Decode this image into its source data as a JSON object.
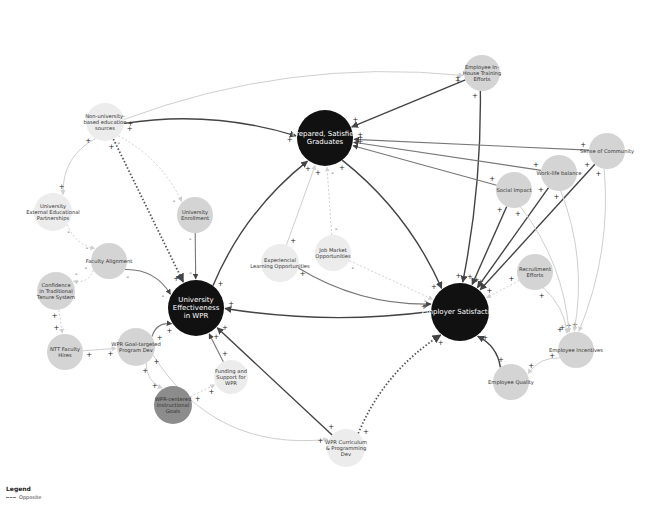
{
  "legend": {
    "title": "Legend",
    "items": [
      {
        "label": "Opposite",
        "style": "dashed"
      }
    ]
  },
  "colors": {
    "major_node": "#111111",
    "minor_node": "#d4d4d4",
    "light_node": "#ececec",
    "dark_node": "#8c8c8c",
    "edge_dark": "#444444",
    "edge_light": "#cfcfcf"
  },
  "nodes": [
    {
      "id": "graduates",
      "label": [
        "Prepared, Satisfied",
        "Graduates"
      ],
      "x": 325,
      "y": 138,
      "r": 28,
      "type": "major"
    },
    {
      "id": "effectiveness",
      "label": [
        "University",
        "Effectiveness",
        "in WPR"
      ],
      "x": 196,
      "y": 308,
      "r": 28,
      "type": "major"
    },
    {
      "id": "employer",
      "label": [
        "Employer Satisfaction"
      ],
      "x": 460,
      "y": 312,
      "r": 29,
      "type": "major"
    },
    {
      "id": "nonuni",
      "label": [
        "Non-university-",
        "based education",
        "sources"
      ],
      "x": 105,
      "y": 122,
      "r": 19,
      "type": "light"
    },
    {
      "id": "extpart",
      "label": [
        "University",
        "External Educational",
        "Partnerships"
      ],
      "x": 53,
      "y": 212,
      "r": 19,
      "type": "light"
    },
    {
      "id": "enrollment",
      "label": [
        "University",
        "Enrollment"
      ],
      "x": 195,
      "y": 215,
      "r": 18,
      "type": "minor"
    },
    {
      "id": "faculty",
      "label": [
        "Faculty Alignment"
      ],
      "x": 109,
      "y": 261,
      "r": 18,
      "type": "minor"
    },
    {
      "id": "tenure",
      "label": [
        "Confidence",
        "in Traditional",
        "Tenure System"
      ],
      "x": 56,
      "y": 291,
      "r": 19,
      "type": "minor"
    },
    {
      "id": "ntt",
      "label": [
        "NTT Faculty",
        "Hires"
      ],
      "x": 65,
      "y": 352,
      "r": 18,
      "type": "minor"
    },
    {
      "id": "goaldev",
      "label": [
        "WPR Goal-targeted",
        "Program Dev"
      ],
      "x": 136,
      "y": 347,
      "r": 19,
      "type": "minor"
    },
    {
      "id": "funding",
      "label": [
        "Funding and",
        "Support for",
        "WPR"
      ],
      "x": 231,
      "y": 377,
      "r": 17,
      "type": "light"
    },
    {
      "id": "instgoals",
      "label": [
        "WPR-centered",
        "Instructional",
        "Goals"
      ],
      "x": 173,
      "y": 405,
      "r": 19,
      "type": "dark"
    },
    {
      "id": "curriculum",
      "label": [
        "WPR Curriculum",
        "& Programming",
        "Dev"
      ],
      "x": 346,
      "y": 448,
      "r": 19,
      "type": "light"
    },
    {
      "id": "experiential",
      "label": [
        "Experiencial",
        "Learning Opportunities"
      ],
      "x": 280,
      "y": 263,
      "r": 19,
      "type": "light"
    },
    {
      "id": "jobmarket",
      "label": [
        "Job Market",
        "Opportunities"
      ],
      "x": 333,
      "y": 253,
      "r": 18,
      "type": "light"
    },
    {
      "id": "training",
      "label": [
        "Employee In-",
        "House Training",
        "Efforts"
      ],
      "x": 482,
      "y": 73,
      "r": 18,
      "type": "minor"
    },
    {
      "id": "community",
      "label": [
        "Sense of Community"
      ],
      "x": 607,
      "y": 151,
      "r": 18,
      "type": "minor"
    },
    {
      "id": "worklife",
      "label": [
        "Work-life balance"
      ],
      "x": 559,
      "y": 173,
      "r": 18,
      "type": "minor"
    },
    {
      "id": "social",
      "label": [
        "Social Impact"
      ],
      "x": 514,
      "y": 190,
      "r": 18,
      "type": "minor"
    },
    {
      "id": "recruitment",
      "label": [
        "Recruitment",
        "Efforts"
      ],
      "x": 535,
      "y": 272,
      "r": 18,
      "type": "minor"
    },
    {
      "id": "incentives",
      "label": [
        "Employee Incentives"
      ],
      "x": 576,
      "y": 350,
      "r": 18,
      "type": "minor"
    },
    {
      "id": "quality",
      "label": [
        "Employee Quality"
      ],
      "x": 511,
      "y": 382,
      "r": 18,
      "type": "minor"
    }
  ],
  "edges": [
    {
      "from": "nonuni",
      "to": "graduates",
      "style": "dark",
      "sign": "+",
      "curve": -20
    },
    {
      "from": "nonuni",
      "to": "effectiveness",
      "style": "dotted",
      "sign": "+",
      "curve": 0
    },
    {
      "from": "nonuni",
      "to": "enrollment",
      "style": "dashed-light",
      "sign": "-",
      "curve": -15
    },
    {
      "from": "nonuni",
      "to": "extpart",
      "style": "light",
      "sign": "+",
      "curve": 20
    },
    {
      "from": "extpart",
      "to": "faculty",
      "style": "dashed-light",
      "sign": "-",
      "curve": 10
    },
    {
      "from": "faculty",
      "to": "tenure",
      "style": "dashed-light",
      "sign": "-",
      "curve": -10
    },
    {
      "from": "tenure",
      "to": "ntt",
      "style": "dashed-light",
      "sign": "+",
      "curve": 0
    },
    {
      "from": "ntt",
      "to": "goaldev",
      "style": "light",
      "sign": "+",
      "curve": 0
    },
    {
      "from": "faculty",
      "to": "effectiveness",
      "style": "medium",
      "sign": "-",
      "curve": -15
    },
    {
      "from": "enrollment",
      "to": "effectiveness",
      "style": "medium",
      "sign": "-",
      "curve": 0
    },
    {
      "from": "goaldev",
      "to": "effectiveness",
      "style": "medium",
      "sign": "+",
      "curve": -10
    },
    {
      "from": "goaldev",
      "to": "instgoals",
      "style": "light",
      "sign": "+",
      "curve": 10
    },
    {
      "from": "instgoals",
      "to": "funding",
      "style": "dashed-light",
      "sign": "+",
      "curve": 0
    },
    {
      "from": "funding",
      "to": "effectiveness",
      "style": "medium",
      "sign": "+",
      "curve": 0
    },
    {
      "from": "curriculum",
      "to": "effectiveness",
      "style": "dark",
      "sign": "+",
      "curve": 0
    },
    {
      "from": "goaldev",
      "to": "curriculum",
      "style": "light",
      "sign": "+",
      "curve": 60
    },
    {
      "from": "curriculum",
      "to": "employer",
      "style": "dotted",
      "sign": "+",
      "curve": -20
    },
    {
      "from": "effectiveness",
      "to": "graduates",
      "style": "dark",
      "sign": "+",
      "curve": -20
    },
    {
      "from": "graduates",
      "to": "employer",
      "style": "dark",
      "sign": "+",
      "curve": -20
    },
    {
      "from": "employer",
      "to": "effectiveness",
      "style": "dark",
      "sign": "+",
      "curve": -15
    },
    {
      "from": "experiential",
      "to": "employer",
      "style": "medium",
      "sign": "+",
      "curve": 20
    },
    {
      "from": "experiential",
      "to": "graduates",
      "style": "light",
      "sign": "+",
      "curve": 0
    },
    {
      "from": "jobmarket",
      "to": "employer",
      "style": "dashed-light",
      "sign": "-",
      "curve": 0
    },
    {
      "from": "jobmarket",
      "to": "graduates",
      "style": "dashed-light",
      "sign": "-",
      "curve": 0
    },
    {
      "from": "training",
      "to": "graduates",
      "style": "dark",
      "sign": "+",
      "curve": 0
    },
    {
      "from": "training",
      "to": "employer",
      "style": "dark",
      "sign": "+",
      "curve": -10
    },
    {
      "from": "nonuni",
      "to": "training",
      "style": "light",
      "sign": "+",
      "curve": -40
    },
    {
      "from": "community",
      "to": "graduates",
      "style": "medium",
      "sign": "+",
      "curve": 0
    },
    {
      "from": "worklife",
      "to": "graduates",
      "style": "medium",
      "sign": "+",
      "curve": 0
    },
    {
      "from": "social",
      "to": "graduates",
      "style": "medium",
      "sign": "+",
      "curve": 0
    },
    {
      "from": "community",
      "to": "employer",
      "style": "dark",
      "sign": "+",
      "curve": 0
    },
    {
      "from": "worklife",
      "to": "employer",
      "style": "dark",
      "sign": "+",
      "curve": 0
    },
    {
      "from": "social",
      "to": "employer",
      "style": "dark",
      "sign": "+",
      "curve": 0
    },
    {
      "from": "recruitment",
      "to": "employer",
      "style": "dashed-light",
      "sign": "+",
      "curve": 0
    },
    {
      "from": "recruitment",
      "to": "incentives",
      "style": "light",
      "sign": "+",
      "curve": -10
    },
    {
      "from": "community",
      "to": "incentives",
      "style": "light",
      "sign": "+",
      "curve": -20
    },
    {
      "from": "worklife",
      "to": "incentives",
      "style": "light",
      "sign": "+",
      "curve": -20
    },
    {
      "from": "social",
      "to": "incentives",
      "style": "light",
      "sign": "+",
      "curve": -20
    },
    {
      "from": "incentives",
      "to": "quality",
      "style": "light",
      "sign": "+",
      "curve": 10
    },
    {
      "from": "quality",
      "to": "employer",
      "style": "dark",
      "sign": "+",
      "curve": 10
    }
  ]
}
